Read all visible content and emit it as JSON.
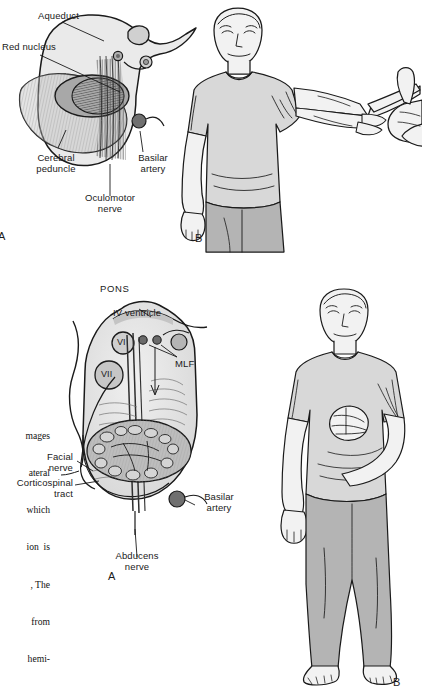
{
  "figure": {
    "title_implied": "Brainstem crossed syndromes",
    "panels": [
      {
        "id": "top",
        "section_label": "A",
        "clinical_label": "B",
        "region": "midbrain",
        "labels": [
          {
            "key": "aqueduct",
            "text": "Aqueduct"
          },
          {
            "key": "red_nucleus",
            "text": "Red nucleus"
          },
          {
            "key": "cerebral_peduncle",
            "text": "Cerebral\npeduncle"
          },
          {
            "key": "basilar_artery",
            "text": "Basilar\nartery"
          },
          {
            "key": "oculomotor_nerve",
            "text": "Oculomotor\nnerve"
          }
        ]
      },
      {
        "id": "bottom",
        "section_label": "A",
        "clinical_label": "B",
        "region": "pons",
        "labels": [
          {
            "key": "pons",
            "text": "PONS"
          },
          {
            "key": "iv_ventricle",
            "text": "IV ventricle"
          },
          {
            "key": "mlf",
            "text": "MLF"
          },
          {
            "key": "nucleus_vi",
            "text": "VI"
          },
          {
            "key": "nucleus_vii",
            "text": "VII"
          },
          {
            "key": "facial_nerve",
            "text": "Facial\nnerve"
          },
          {
            "key": "corticospinal_tract",
            "text": "Corticospinal\ntract"
          },
          {
            "key": "basilar_artery",
            "text": "Basilar\nartery"
          },
          {
            "key": "abducens_nerve",
            "text": "Abducens\nnerve"
          }
        ]
      }
    ]
  },
  "caption": {
    "lines": [
      "mages",
      "ateral",
      "which",
      "ion  is",
      ", The",
      "from",
      "hemi-"
    ],
    "note": "left-clipped serif caption column"
  },
  "colors": {
    "ink": "#1a1a1a",
    "tissue_light": "#e8e8e8",
    "tissue_mid": "#c9c9c9",
    "tissue_dark": "#9a9a9a",
    "nucleus_dark": "#6e6e6e",
    "artery": "#707070",
    "shirt": "#d8d8d8",
    "pants": "#b4b4b4",
    "skin": "#f2f2f2",
    "page": "#ffffff"
  }
}
